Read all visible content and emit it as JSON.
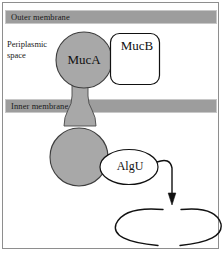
{
  "figure": {
    "width": 223,
    "height": 253
  },
  "labels": {
    "outer_membrane": "Outer membrane",
    "inner_membrane": "Inner membrane",
    "periplasmic_space": "Periplasmic\nspace",
    "periplasmic_line1": "Periplasmic",
    "periplasmic_line2": "space"
  },
  "proteins": {
    "muca": "MucA",
    "mucb": "MucB",
    "algu": "AlgU"
  },
  "colors": {
    "membrane_fill": "#9d9d9d",
    "membrane_stroke": "#c8c8c8",
    "protein_fill": "#a8a8a8",
    "protein_stroke": "#4a4a4a",
    "white_fill": "#ffffff",
    "outline": "#111111",
    "background": "#ffffff",
    "border": "#8e8e8e"
  },
  "elements": {
    "muca_periplasmic_domain": "gray filled circle labeled MucA spanning periplasmic space",
    "muca_transmembrane_stem": "gray stem crossing inner membrane",
    "muca_cytoplasmic_domain": "gray filled circle in cytoplasm",
    "mucb_box": "white rounded rectangle labeled MucB",
    "algu_ellipse": "white ellipse labeled AlgU",
    "arrow": "curved arrow from AlgU pointing down to DNA",
    "dna_loop": "broken ellipse representing DNA promoter region"
  }
}
